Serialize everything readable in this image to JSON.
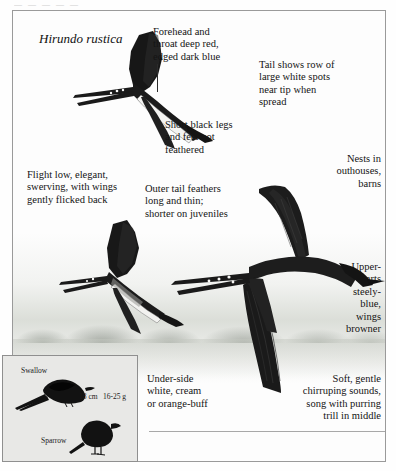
{
  "page": {
    "scan_top_artifact": "— — — — —",
    "species_scientific_name": "Hirundo rustica"
  },
  "annotations": [
    {
      "id": "forehead",
      "text": "Forehead and throat deep red, edged dark blue"
    },
    {
      "id": "tail-spots",
      "text": "Tail shows row of large white spots near tip when spread"
    },
    {
      "id": "legs",
      "text": "Short black legs and feet not feathered"
    },
    {
      "id": "nests",
      "text": "Nests in outhouses, barns"
    },
    {
      "id": "flight",
      "text": "Flight low, elegant, swerving, with wings gently flicked back"
    },
    {
      "id": "outer-tail",
      "text": "Outer tail feathers long and thin; shorter on juveniles"
    },
    {
      "id": "upperparts",
      "text": "Upper-parts steely-blue, wings browner"
    },
    {
      "id": "underside",
      "text": "Under-side white, cream or orange-buff"
    },
    {
      "id": "voice",
      "text": "Soft, gentle chirruping sounds, song with purring trill in middle"
    }
  ],
  "annotation_lines": {
    "forehead": "Forehead and",
    "forehead2": "throat deep red,",
    "forehead3": "edged dark blue",
    "tail1": "Tail shows row of",
    "tail2": "large white spots",
    "tail3": "near tip when",
    "tail4": "spread",
    "legs1": "Short black legs",
    "legs2": "and feet not",
    "legs3": "feathered",
    "nests1": "Nests in",
    "nests2": "outhouses,",
    "nests3": "barns",
    "flight1": "Flight low, elegant,",
    "flight2": "swerving, with wings",
    "flight3": "gently flicked back",
    "outer1": "Outer tail feathers",
    "outer2": "long and thin;",
    "outer3": "shorter on juveniles",
    "upper1": "Upper-",
    "upper2": "parts",
    "upper3": "steely-",
    "upper4": "blue,",
    "upper5": "wings",
    "upper6": "browner",
    "under1": "Under-side",
    "under2": "white, cream",
    "under3": "or orange-buff",
    "voice1": "Soft, gentle",
    "voice2": "chirruping sounds,",
    "voice3": "song with purring",
    "voice4": "trill in middle"
  },
  "size_comparison": {
    "top_bird_label": "Swallow",
    "bottom_bird_label": "Sparrow",
    "length": "18 cm",
    "weight": "16-25 g"
  },
  "colors": {
    "ink": "#141414",
    "frame": "#9a9a9a",
    "box_fill": "#e8e8e6",
    "bird_black": "#151515",
    "mist": "#ced2ca"
  }
}
